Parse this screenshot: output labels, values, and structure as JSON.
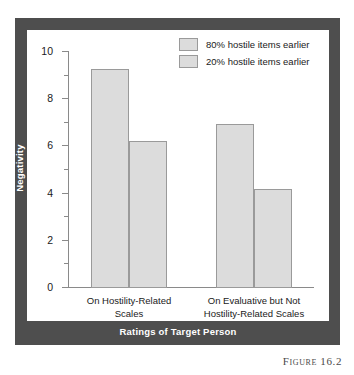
{
  "figure": {
    "caption": "Figure 16.2"
  },
  "chart_data": {
    "type": "bar",
    "title": "",
    "xlabel": "Ratings of Target Person",
    "ylabel": "Negativity",
    "ylim": [
      0,
      10
    ],
    "ytick_labels": [
      "0",
      "2",
      "4",
      "6",
      "8",
      "10"
    ],
    "ytick_values": [
      0,
      2,
      4,
      6,
      8,
      10
    ],
    "yminor_values": [
      1,
      3,
      5,
      7,
      9
    ],
    "grid": false,
    "legend_position": "top-right",
    "categories": [
      "On Hostility-Related Scales",
      "On Evaluative but Not Hostility-Related Scales"
    ],
    "category_lines": [
      [
        "On Hostility-Related",
        "Scales"
      ],
      [
        "On Evaluative but Not",
        "Hostility-Related Scales"
      ]
    ],
    "series": [
      {
        "name": "80% hostile items earlier",
        "color": "#dcdcdc",
        "values": [
          9.25,
          6.9
        ]
      },
      {
        "name": "20% hostile items earlier",
        "color": "#dcdcdc",
        "values": [
          6.2,
          4.15
        ]
      }
    ]
  },
  "colors": {
    "frame": "#4e4e4e",
    "panel": "#ffffff",
    "bar_fill": "#dcdcdc",
    "bar_stroke": "#9a9a9a",
    "axis": "#8a8a8a",
    "text": "#1a1a1a",
    "title_text": "#ffffff"
  }
}
